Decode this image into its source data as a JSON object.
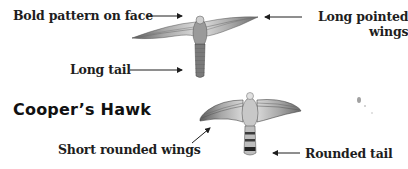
{
  "species_top": {
    "labels": {
      "face": "Bold pattern on face",
      "wings_line1": "Long pointed",
      "wings_line2": "wings",
      "tail": "Long tail"
    }
  },
  "species_bottom": {
    "title": "Cooper’s Hawk",
    "labels": {
      "wings": "Short rounded wings",
      "tail": "Rounded tail"
    }
  },
  "colors": {
    "text": "#1e1e1e",
    "bird_dark": "#4a4a4a",
    "bird_mid": "#8a8a8a",
    "bird_light": "#d6d6d6"
  }
}
